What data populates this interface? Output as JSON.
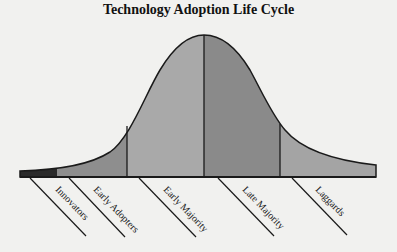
{
  "title": "Technology Adoption Life Cycle",
  "segments": [
    {
      "label": "Innovators",
      "color": "#2a2a2a"
    },
    {
      "label": "Early Adopters",
      "color": "#8e8e8e"
    },
    {
      "label": "Early Majority",
      "color": "#a9a9a9"
    },
    {
      "label": "Late Majority",
      "color": "#8a8a8a"
    },
    {
      "label": "Laggards",
      "color": "#a4a4a4"
    }
  ],
  "colors": {
    "background": "#f1f1ef",
    "outline": "#1a1a1a"
  }
}
